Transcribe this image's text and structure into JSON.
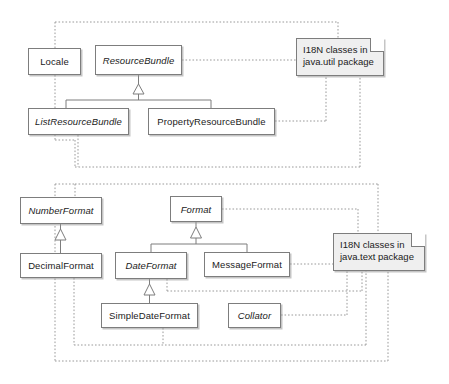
{
  "diagram": {
    "background": "#ffffff",
    "box_border_color": "#7d7d7d",
    "note_fill_color": "#efefef",
    "package_border_color": "#9a9a9a",
    "packages": [
      {
        "name": "java.util package group",
        "x": 55,
        "y": 22,
        "w": 305,
        "h": 145
      },
      {
        "name": "java.text package group",
        "x": 55,
        "y": 184,
        "w": 333,
        "h": 177
      }
    ],
    "classes": [
      {
        "id": "locale",
        "label": "Locale",
        "abstract": false,
        "x": 28,
        "y": 48,
        "w": 53,
        "h": 27
      },
      {
        "id": "resource_bundle",
        "label": "ResourceBundle",
        "abstract": true,
        "x": 95,
        "y": 45,
        "w": 87,
        "h": 30
      },
      {
        "id": "list_resource_bundle",
        "label": "ListResourceBundle",
        "abstract": true,
        "x": 28,
        "y": 108,
        "w": 101,
        "h": 27
      },
      {
        "id": "property_resource_bundle",
        "label": "PropertyResourceBundle",
        "abstract": false,
        "x": 148,
        "y": 108,
        "w": 127,
        "h": 27
      },
      {
        "id": "number_format",
        "label": "NumberFormat",
        "abstract": true,
        "x": 20,
        "y": 197,
        "w": 82,
        "h": 27
      },
      {
        "id": "format",
        "label": "Format",
        "abstract": true,
        "x": 170,
        "y": 196,
        "w": 52,
        "h": 26
      },
      {
        "id": "decimal_format",
        "label": "DecimalFormat",
        "abstract": false,
        "x": 20,
        "y": 253,
        "w": 82,
        "h": 25
      },
      {
        "id": "date_format",
        "label": "DateFormat",
        "abstract": true,
        "x": 115,
        "y": 252,
        "w": 72,
        "h": 27
      },
      {
        "id": "message_format",
        "label": "MessageFormat",
        "abstract": false,
        "x": 204,
        "y": 252,
        "w": 86,
        "h": 25
      },
      {
        "id": "simple_date_format",
        "label": "SimpleDateFormat",
        "abstract": false,
        "x": 101,
        "y": 303,
        "w": 97,
        "h": 25
      },
      {
        "id": "collator",
        "label": "Collator",
        "abstract": true,
        "x": 228,
        "y": 303,
        "w": 53,
        "h": 25
      }
    ],
    "notes": [
      {
        "id": "note_util",
        "text": "I18N classes in\njava.util package",
        "x": 296,
        "y": 38,
        "w": 88,
        "h": 38
      },
      {
        "id": "note_text",
        "text": "I18N classes in\njava.text package",
        "x": 333,
        "y": 233,
        "w": 92,
        "h": 38
      }
    ],
    "generalizations": [
      {
        "from": "list_resource_bundle",
        "to": "resource_bundle"
      },
      {
        "from": "property_resource_bundle",
        "to": "resource_bundle"
      },
      {
        "from": "decimal_format",
        "to": "number_format"
      },
      {
        "from": "date_format",
        "to": "format"
      },
      {
        "from": "message_format",
        "to": "format"
      },
      {
        "from": "simple_date_format",
        "to": "date_format"
      }
    ],
    "note_links": [
      {
        "from": "note_util",
        "to": "resource_bundle"
      },
      {
        "from": "note_util",
        "to": "property_resource_bundle"
      },
      {
        "from": "note_util",
        "to": "locale"
      },
      {
        "from": "note_util",
        "to": "list_resource_bundle"
      },
      {
        "from": "note_text",
        "to": "format"
      },
      {
        "from": "note_text",
        "to": "message_format"
      },
      {
        "from": "note_text",
        "to": "date_format"
      },
      {
        "from": "note_text",
        "to": "collator"
      },
      {
        "from": "note_text",
        "to": "number_format"
      },
      {
        "from": "note_text",
        "to": "decimal_format"
      },
      {
        "from": "note_text",
        "to": "simple_date_format"
      }
    ]
  }
}
